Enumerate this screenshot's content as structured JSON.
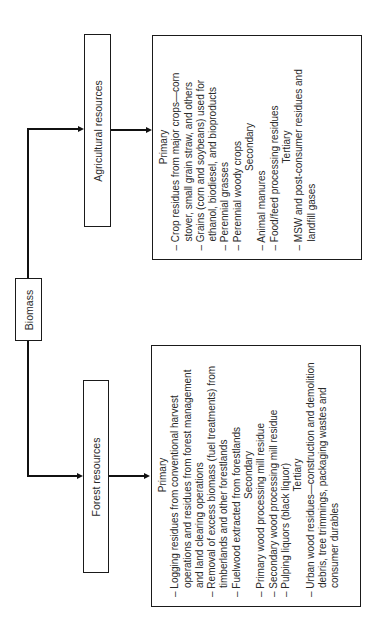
{
  "root": {
    "label": "Biomass"
  },
  "branches": {
    "agricultural": {
      "label": "Agricultural resources",
      "sections": [
        {
          "heading": "Primary",
          "items": [
            "Crop residues from major crops—corn stover, small grain straw, and others",
            "Grains (corn and soybeans) used for ethanol, biodiesel, and bioproducts",
            "Perennial grasses",
            "Perennial woody crops"
          ]
        },
        {
          "heading": "Secondary",
          "items": [
            "Animal manures",
            "Food/feed processing residues"
          ]
        },
        {
          "heading": "Tertiary",
          "items": [
            "MSW and post-consumer residues and landfill gases"
          ]
        }
      ]
    },
    "forest": {
      "label": "Forest resources",
      "sections": [
        {
          "heading": "Primary",
          "items": [
            "Logging residues from conventional harvest operations and residues from forest management and land clearing operations",
            "Removal of excess biomass (fuel treatments) from timberlands and other forestlands",
            "Fuelwood extracted from forestlands"
          ]
        },
        {
          "heading": "Secondary",
          "items": [
            "Primary wood processing mill residue",
            "Secondary wood processing mill residue",
            "Pulping liquors (black liquor)"
          ]
        },
        {
          "heading": "Tertiary",
          "items": [
            "Urban wood residues—construction and demolition debris, tree trimmings, packaging wastes and consumer durables"
          ]
        }
      ]
    }
  },
  "colors": {
    "line": "#111111",
    "border": "#1a1a1a",
    "text": "#2a2a2a",
    "background": "#ffffff"
  }
}
